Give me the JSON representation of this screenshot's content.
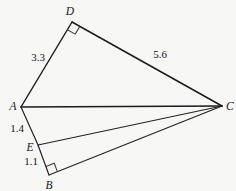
{
  "figure": {
    "background_color": "#f7f7f5",
    "stroke_color": "#1b1b1f",
    "width": 236,
    "height": 191,
    "vertices": [
      {
        "name": "A",
        "label": "A",
        "x": 21,
        "y": 107,
        "label_x": 13,
        "label_y": 107
      },
      {
        "name": "D",
        "label": "D",
        "x": 72,
        "y": 22,
        "label_x": 70,
        "label_y": 12
      },
      {
        "name": "C",
        "label": "C",
        "x": 222,
        "y": 106,
        "label_x": 230,
        "label_y": 107
      },
      {
        "name": "E",
        "label": "E",
        "x": 38,
        "y": 145,
        "label_x": 30,
        "label_y": 148
      },
      {
        "name": "B",
        "label": "B",
        "x": 49,
        "y": 175,
        "label_x": 49,
        "label_y": 186
      }
    ],
    "edges": [
      {
        "name": "segment-AD",
        "from": "A",
        "to": "D"
      },
      {
        "name": "segment-DC",
        "from": "D",
        "to": "C"
      },
      {
        "name": "segment-AC",
        "from": "A",
        "to": "C"
      },
      {
        "name": "segment-AE",
        "from": "A",
        "to": "E"
      },
      {
        "name": "segment-EC",
        "from": "E",
        "to": "C"
      },
      {
        "name": "segment-EB",
        "from": "E",
        "to": "B"
      },
      {
        "name": "segment-BC",
        "from": "B",
        "to": "C"
      }
    ],
    "length_labels": [
      {
        "name": "length-AD",
        "value": "3.3",
        "x": 38,
        "y": 57
      },
      {
        "name": "length-DC",
        "value": "5.6",
        "x": 160,
        "y": 54
      },
      {
        "name": "length-AE",
        "value": "1.4",
        "x": 17,
        "y": 128
      },
      {
        "name": "length-EB",
        "value": "1.1",
        "x": 31,
        "y": 161
      }
    ],
    "right_angles": [
      {
        "name": "right-angle-at-D",
        "at": "D",
        "size": 9
      },
      {
        "name": "right-angle-at-B",
        "at": "B",
        "size": 9
      }
    ]
  }
}
